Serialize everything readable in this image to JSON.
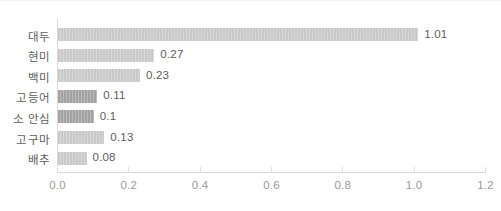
{
  "chart_data": {
    "type": "bar",
    "orientation": "horizontal",
    "title": "",
    "subtitle": "",
    "xlabel": "",
    "ylabel": "",
    "categories": [
      "대두",
      "현미",
      "백미",
      "고등어",
      "소 안심",
      "고구마",
      "배추"
    ],
    "values": [
      1.01,
      0.27,
      0.23,
      0.11,
      0.1,
      0.13,
      0.08
    ],
    "value_labels": [
      "1.01",
      "0.27",
      "0.23",
      "0.11",
      "0.1",
      "0.13",
      "0.08"
    ],
    "bar_colors": [
      "#c9c9c9",
      "#c9c9c9",
      "#c9c9c9",
      "#a2a2a2",
      "#a2a2a2",
      "#c9c9c9",
      "#c9c9c9"
    ],
    "xlim": [
      0.0,
      1.2
    ],
    "xticks": [
      0.0,
      0.2,
      0.4,
      0.6,
      0.8,
      1.0,
      1.2
    ],
    "xtick_labels": [
      "0.0",
      "0.2",
      "0.4",
      "0.6",
      "0.8",
      "1.0",
      "1.2"
    ],
    "grid": false,
    "legend": null,
    "legend_position": "none",
    "annotations": []
  },
  "style": {
    "background": "#ffffff",
    "axis_line_color": "#d9d9d9",
    "tick_color": "#dedede",
    "tick_label_color": "#9a9a9a",
    "category_label_color": "#5d5d5d",
    "value_label_color": "#5d5d5d",
    "bar_light": "#c9c9c9",
    "bar_dark": "#a2a2a2"
  }
}
